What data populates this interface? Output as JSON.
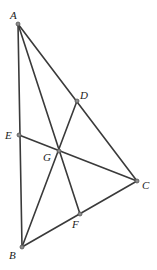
{
  "diagram": {
    "title": "",
    "points": [
      {
        "name": "A",
        "x": 18,
        "y": 24,
        "label_x": 10,
        "label_y": 19
      },
      {
        "name": "B",
        "x": 22,
        "y": 247,
        "label_x": 9,
        "label_y": 259
      },
      {
        "name": "C",
        "x": 137,
        "y": 181,
        "label_x": 142,
        "label_y": 189
      },
      {
        "name": "D",
        "x": 77,
        "y": 101,
        "label_x": 80,
        "label_y": 99
      },
      {
        "name": "E",
        "x": 19,
        "y": 135,
        "label_x": 5,
        "label_y": 139
      },
      {
        "name": "F",
        "x": 80,
        "y": 214,
        "label_x": 72,
        "label_y": 228
      },
      {
        "name": "G",
        "x": 59,
        "y": 151,
        "label_x": 43,
        "label_y": 161
      }
    ],
    "segments": [
      {
        "from": "A",
        "to": "B"
      },
      {
        "from": "A",
        "to": "C"
      },
      {
        "from": "B",
        "to": "C"
      },
      {
        "from": "A",
        "to": "F"
      },
      {
        "from": "B",
        "to": "D"
      },
      {
        "from": "C",
        "to": "E"
      }
    ],
    "labels": {
      "A": "A",
      "B": "B",
      "C": "C",
      "D": "D",
      "E": "E",
      "F": "F",
      "G": "G"
    },
    "colors": {
      "line": "#3a3a3a",
      "point": "#8a8a8a",
      "label": "#222222",
      "background": "#ffffff"
    }
  }
}
